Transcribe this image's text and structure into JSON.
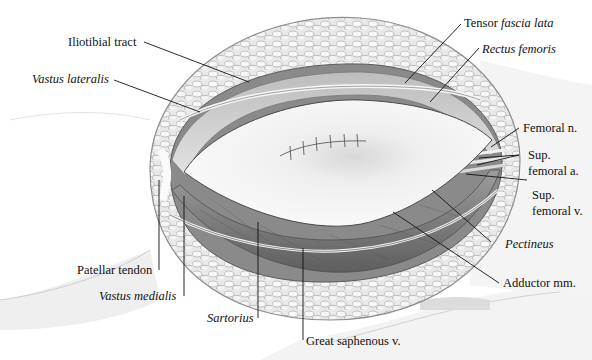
{
  "figure": {
    "colors": {
      "background": "#ffffff",
      "fat_pad": "#e6e6e6",
      "fat_outline": "#9a9a9a",
      "skin_shadow": "#d9d9d9",
      "muscle_dark": "#6e6e6e",
      "muscle_mid": "#a8a8a8",
      "flap": "#f2f2f2",
      "leader_line": "#111111"
    },
    "labels": {
      "iliotibial_tract": "Iliotibial tract",
      "vastus_lateralis": "Vastus lateralis",
      "tensor_prefix": "Tensor ",
      "tensor_italic": "fascia lata",
      "rectus_femoris": "Rectus femoris",
      "femoral_n": "Femoral n.",
      "sup_femoral_a_line1": "Sup.",
      "sup_femoral_a_line2": "femoral a.",
      "sup_femoral_v_line1": "Sup.",
      "sup_femoral_v_line2": "femoral v.",
      "pectineus": "Pectineus",
      "adductor_mm": "Adductor mm.",
      "patellar_tendon": "Patellar tendon",
      "vastus_medialis": "Vastus medialis",
      "sartorius": "Sartorius",
      "great_saphenous_v": "Great saphenous v."
    }
  }
}
